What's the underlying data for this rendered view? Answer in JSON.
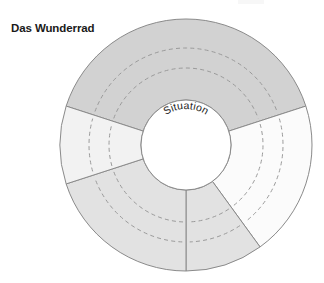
{
  "figure": {
    "title": "Das Wunderrad",
    "center_label": "Situation",
    "type": "concentric-wheel-diagram",
    "background_color": "#ffffff",
    "outline_color": "#8a8a8a",
    "dash_color": "#9a9a9a",
    "geometry": {
      "center_x": 186,
      "center_y": 145,
      "outer_radius": 126,
      "inner_radius": 45,
      "dashed_ring_radii": [
        77,
        97
      ]
    },
    "segments": [
      {
        "name": "top",
        "start_angle": -162,
        "end_angle": -18,
        "fill": "#d2d2d2"
      },
      {
        "name": "upper-right",
        "start_angle": -18,
        "end_angle": 54,
        "fill": "#fbfbfb"
      },
      {
        "name": "lower-right",
        "start_angle": 54,
        "end_angle": 90,
        "fill": "#e2e2e2"
      },
      {
        "name": "lower-left",
        "start_angle": 90,
        "end_angle": 162,
        "fill": "#e2e2e2"
      },
      {
        "name": "upper-left",
        "start_angle": 162,
        "end_angle": 198,
        "fill": "#f2f2f2"
      }
    ]
  }
}
